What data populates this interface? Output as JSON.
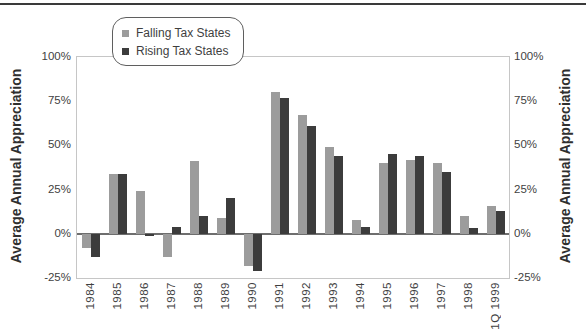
{
  "legend": {
    "items": [
      {
        "label": "Falling Tax States",
        "color": "#9c9c9c"
      },
      {
        "label": "Rising Tax States",
        "color": "#3c3c3c"
      }
    ]
  },
  "left_axis": {
    "title": "Average Annual Appreciation"
  },
  "right_axis": {
    "title": "Average Annual Appreciation"
  },
  "chart_data": {
    "type": "bar",
    "title": "",
    "categories": [
      "1984",
      "1985",
      "1986",
      "1987",
      "1988",
      "1989",
      "1990",
      "1991",
      "1992",
      "1993",
      "1994",
      "1995",
      "1996",
      "1997",
      "1998",
      "1Q 1999"
    ],
    "series": [
      {
        "name": "Falling Tax States",
        "color": "#9c9c9c",
        "values": [
          -8,
          34,
          24,
          -13,
          41,
          9,
          -18,
          80,
          67,
          49,
          8,
          40,
          42,
          40,
          10,
          16
        ]
      },
      {
        "name": "Rising Tax States",
        "color": "#3c3c3c",
        "values": [
          -13,
          34,
          -1,
          4,
          10,
          20,
          -21,
          77,
          61,
          44,
          4,
          45,
          44,
          35,
          3,
          13
        ]
      }
    ],
    "ylabel": "Average Annual Appreciation",
    "ylabel_right": "Average Annual Appreciation",
    "ylim": [
      -25,
      100
    ],
    "yticks": [
      100,
      75,
      50,
      25,
      0,
      -25
    ],
    "ytick_labels": [
      "100%",
      "75%",
      "50%",
      "25%",
      "0%",
      "-25%"
    ],
    "grid": false,
    "legend_position": "top-left",
    "bar_orientation": "vertical"
  }
}
